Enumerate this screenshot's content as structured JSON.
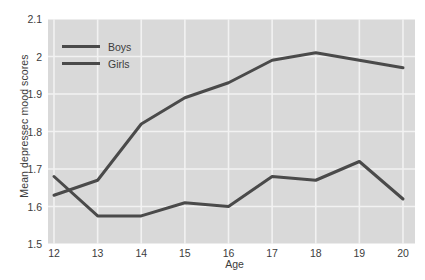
{
  "chart_data": {
    "type": "line",
    "title": "",
    "xlabel": "Age",
    "ylabel": "Mean depressec mood scores",
    "x": [
      12,
      13,
      14,
      15,
      16,
      17,
      18,
      19,
      20
    ],
    "xticklabels": [
      "12",
      "13",
      "14",
      "15",
      "16",
      "17",
      "18",
      "19",
      "20"
    ],
    "yticklabels": [
      "1.5",
      "1.6",
      "1.7",
      "1.8",
      "1.9",
      "2",
      "2.1"
    ],
    "yticks": [
      1.5,
      1.6,
      1.7,
      1.8,
      1.9,
      2.0,
      2.1
    ],
    "xlim": [
      12,
      20
    ],
    "ylim": [
      1.5,
      2.1
    ],
    "grid": true,
    "legend_position": "upper-left-inside",
    "series": [
      {
        "name": "Boys",
        "color": "#4a4a4a",
        "values": [
          1.68,
          1.575,
          1.575,
          1.61,
          1.6,
          1.68,
          1.67,
          1.72,
          1.62
        ]
      },
      {
        "name": "Girls",
        "color": "#4a4a4a",
        "values": [
          1.63,
          1.67,
          1.82,
          1.89,
          1.93,
          1.99,
          2.01,
          1.99,
          1.97
        ]
      }
    ],
    "style": {
      "plot_background": "#d9d9d9",
      "gridline_color": "#f2f2f2",
      "text_color": "#3c3c3c",
      "line_width": 3
    }
  }
}
